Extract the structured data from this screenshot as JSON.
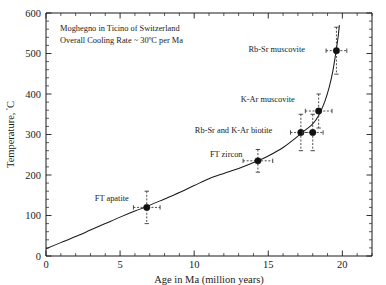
{
  "chart_data": {
    "type": "scatter",
    "title": "",
    "annotations": [
      "Moghegno in Ticino of Switzerland",
      "Overall Cooling Rate ~ 30ºC per Ma"
    ],
    "xlabel": "Age in Ma (million years)",
    "ylabel": "Temperature, ºC",
    "ylabel_main": "Temperature, ",
    "ylabel_unit": "ºC",
    "xlim": [
      0,
      22
    ],
    "ylim": [
      0,
      600
    ],
    "xticks": [
      0,
      5,
      10,
      15,
      20
    ],
    "xticklabels": [
      "0",
      "5",
      "10",
      "15",
      "20"
    ],
    "yticks": [
      0,
      100,
      200,
      300,
      400,
      500,
      600
    ],
    "yticklabels": [
      "0",
      "100",
      "200",
      "300",
      "400",
      "500",
      "600"
    ],
    "x_minor_step": 1,
    "y_minor_step": 20,
    "grid": false,
    "legend": "none",
    "points": [
      {
        "label": "FT apatite",
        "x": 6.8,
        "y": 120,
        "xerr": 0.9,
        "yerr": 40,
        "label_dx": -52,
        "label_dy": -9
      },
      {
        "label": "FT zircon",
        "x": 14.3,
        "y": 235,
        "xerr": 1.0,
        "yerr": 28,
        "label_dx": -48,
        "label_dy": -7
      },
      {
        "label": "Rb-Sr and K-Ar biotite",
        "x": 17.2,
        "y": 305,
        "xerr": 0.7,
        "yerr": 45,
        "label_dx": -106,
        "label_dy": -2
      },
      {
        "label": "",
        "x": 18.0,
        "y": 305,
        "xerr": 0.7,
        "yerr": 45,
        "label_dx": 0,
        "label_dy": 0
      },
      {
        "label": "K-Ar muscovite",
        "x": 18.4,
        "y": 358,
        "xerr": 0.9,
        "yerr": 42,
        "label_dx": -78,
        "label_dy": -12
      },
      {
        "label": "Rb-Sr muscovite",
        "x": 19.6,
        "y": 507,
        "xerr": 0.7,
        "yerr": 58,
        "label_dx": -88,
        "label_dy": -2
      }
    ],
    "curve_description": "Cooling path curve rising from ~18ºC at 0 Ma to ~570ºC near 19.8 Ma",
    "curve_points": [
      [
        0.0,
        18
      ],
      [
        1.0,
        33
      ],
      [
        2.0,
        48
      ],
      [
        3.0,
        64
      ],
      [
        4.0,
        80
      ],
      [
        5.0,
        96
      ],
      [
        6.0,
        111
      ],
      [
        6.8,
        122
      ],
      [
        8.0,
        141
      ],
      [
        9.0,
        157
      ],
      [
        10.0,
        174
      ],
      [
        11.0,
        191
      ],
      [
        12.0,
        204
      ],
      [
        13.0,
        216
      ],
      [
        14.3,
        235
      ],
      [
        15.0,
        247
      ],
      [
        16.0,
        268
      ],
      [
        17.0,
        296
      ],
      [
        17.2,
        303
      ],
      [
        17.6,
        314
      ],
      [
        18.0,
        326
      ],
      [
        18.4,
        347
      ],
      [
        18.8,
        380
      ],
      [
        19.1,
        415
      ],
      [
        19.35,
        455
      ],
      [
        19.55,
        500
      ],
      [
        19.7,
        537
      ],
      [
        19.8,
        570
      ]
    ],
    "colors": {
      "axis": "#1a1a1a",
      "curve": "#1a1a1a",
      "point": "#111111",
      "errorbar": "#3a3a3a",
      "background": "#ffffff"
    }
  }
}
